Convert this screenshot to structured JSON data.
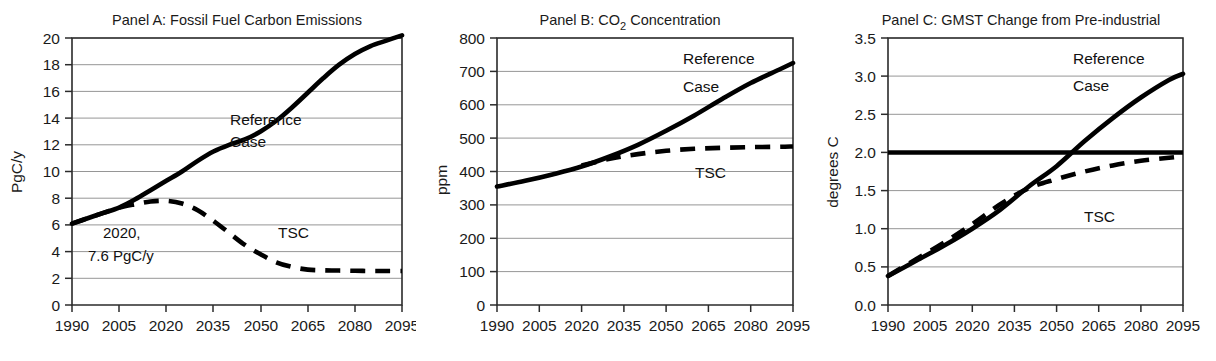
{
  "figure": {
    "panel_count": 3,
    "line_color": "#000000",
    "grid_color": "#8a8a8a"
  },
  "chart_data": [
    {
      "id": "panelA",
      "type": "line",
      "title": "Panel A: Fossil Fuel Carbon Emissions",
      "xlabel": "",
      "ylabel": "PgC/y",
      "xlim": [
        1990,
        2095
      ],
      "ylim": [
        0,
        20
      ],
      "grid": true,
      "legend": "inline-annotation",
      "xticks": [
        1990,
        2005,
        2020,
        2035,
        2050,
        2065,
        2080,
        2095
      ],
      "yticks": [
        0,
        2,
        4,
        6,
        8,
        10,
        12,
        14,
        16,
        18,
        20
      ],
      "annotations": [
        {
          "text_line1": "2020,",
          "text_line2": "7.6 PgC/y",
          "x": 2020,
          "y": 6.0
        }
      ],
      "series": [
        {
          "name": "Reference Case",
          "style": "solid",
          "label_lines": [
            "Reference",
            "Case"
          ],
          "x": [
            1990,
            1995,
            2000,
            2005,
            2010,
            2015,
            2020,
            2025,
            2030,
            2035,
            2040,
            2045,
            2050,
            2055,
            2060,
            2065,
            2070,
            2075,
            2080,
            2085,
            2090,
            2095
          ],
          "values": [
            6.1,
            6.5,
            6.9,
            7.3,
            7.9,
            8.6,
            9.3,
            10.0,
            10.8,
            11.5,
            12.0,
            12.4,
            13.0,
            13.8,
            14.8,
            15.9,
            17.0,
            18.0,
            18.8,
            19.4,
            19.8,
            20.2
          ]
        },
        {
          "name": "TSC",
          "style": "dashed",
          "label_lines": [
            "TSC"
          ],
          "x": [
            1990,
            1995,
            2000,
            2005,
            2010,
            2015,
            2020,
            2025,
            2030,
            2035,
            2040,
            2045,
            2050,
            2055,
            2060,
            2065,
            2070,
            2075,
            2080,
            2085,
            2090,
            2095
          ],
          "values": [
            6.1,
            6.5,
            6.9,
            7.3,
            7.55,
            7.75,
            7.8,
            7.6,
            7.1,
            6.3,
            5.4,
            4.5,
            3.8,
            3.2,
            2.85,
            2.65,
            2.6,
            2.58,
            2.56,
            2.55,
            2.55,
            2.55
          ]
        }
      ]
    },
    {
      "id": "panelB",
      "type": "line",
      "title": "Panel B:  CO2 Concentration",
      "title_prefix": "Panel B:  CO",
      "title_sub": "2",
      "title_suffix": " Concentration",
      "xlabel": "",
      "ylabel": "ppm",
      "xlim": [
        1990,
        2095
      ],
      "ylim": [
        0,
        800
      ],
      "grid": true,
      "xticks": [
        1990,
        2005,
        2020,
        2035,
        2050,
        2065,
        2080,
        2095
      ],
      "yticks": [
        0,
        100,
        200,
        300,
        400,
        500,
        600,
        700,
        800
      ],
      "series": [
        {
          "name": "Reference Case",
          "style": "solid",
          "label_lines": [
            "Reference",
            "Case"
          ],
          "x": [
            1990,
            2000,
            2010,
            2020,
            2030,
            2040,
            2050,
            2060,
            2070,
            2080,
            2090,
            2095
          ],
          "values": [
            355,
            372,
            392,
            415,
            445,
            480,
            522,
            568,
            618,
            665,
            705,
            725
          ]
        },
        {
          "name": "TSC",
          "style": "dashed",
          "label_lines": [
            "TSC"
          ],
          "x": [
            2020,
            2030,
            2040,
            2050,
            2060,
            2070,
            2080,
            2090,
            2095
          ],
          "values": [
            418,
            438,
            452,
            462,
            468,
            471,
            473,
            474,
            475
          ]
        }
      ]
    },
    {
      "id": "panelC",
      "type": "line",
      "title": "Panel C: GMST Change from Pre-industrial",
      "xlabel": "",
      "ylabel": "degrees C",
      "xlim": [
        1990,
        2095
      ],
      "ylim": [
        0.0,
        3.5
      ],
      "grid": true,
      "xticks": [
        1990,
        2005,
        2020,
        2035,
        2050,
        2065,
        2080,
        2095
      ],
      "yticks": [
        "0.0",
        "0.5",
        "1.0",
        "1.5",
        "2.0",
        "2.5",
        "3.0",
        "3.5"
      ],
      "series": [
        {
          "name": "Threshold 2C",
          "style": "solid-horizontal",
          "value": 2.0,
          "label_lines": []
        },
        {
          "name": "Reference Case",
          "style": "solid",
          "label_lines": [
            "Reference",
            "Case"
          ],
          "x": [
            1990,
            2000,
            2010,
            2020,
            2030,
            2040,
            2050,
            2060,
            2070,
            2080,
            2090,
            2095
          ],
          "values": [
            0.38,
            0.58,
            0.78,
            1.0,
            1.25,
            1.55,
            1.82,
            2.15,
            2.45,
            2.72,
            2.95,
            3.03
          ]
        },
        {
          "name": "TSC",
          "style": "dashed",
          "label_lines": [
            "TSC"
          ],
          "x": [
            1990,
            2000,
            2010,
            2020,
            2030,
            2040,
            2050,
            2060,
            2070,
            2080,
            2090,
            2095
          ],
          "values": [
            0.38,
            0.6,
            0.82,
            1.06,
            1.32,
            1.53,
            1.65,
            1.75,
            1.83,
            1.89,
            1.93,
            1.95
          ]
        }
      ]
    }
  ]
}
